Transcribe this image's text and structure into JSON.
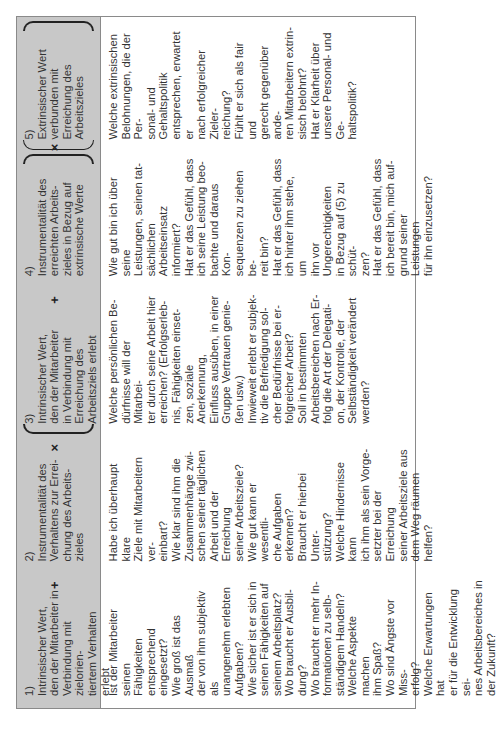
{
  "columns": [
    {
      "header": "1)\nIntrinsischer Wert,\nden der Mitarbeiter in\nVerbindung mit zielorien-\ntiertem Verhalten erlebt",
      "operator": "+",
      "body": "Ist der Mitarbeiter seinen\nFähigkeiten entsprechend\neingesetzt?\nWie groß ist das Ausmaß\nder von ihm subjektiv als\nunangenehm erlebten\nAufgaben?\nWie sicher ist er sich in\nseinen Fähigkeiten auf\nseinem Arbeitsplatz?\nWo braucht er Ausbil-\ndung?\nWo braucht er mehr In-\nformationen zu selb-\nständigem Handeln?\nWelche Aspekte machen\nihm Spaß?\nWo sind Ängste vor Miss-\nerfolg?\nWelche Erwartungen hat\ner für die Entwicklung sei-\nnes Arbeitsbereiches in\nder Zukunft?"
    },
    {
      "header": "2)\nInstrumentalität des\nVerhaltens zur Errei-\nchung des Arbeits-\nzieles",
      "operator": "×",
      "body": "Habe ich überhaupt klare\nZiele mit Mitarbeitern ver-\neinbart?\nWie klar sind ihm die\nZusammenhänge zwi-\nschen seiner täglichen\nArbeit und der Erreichung\nseiner Arbeitsziele?\nWie gut kann er wesentli-\nche Aufgaben erkennen?\nBraucht er hierbei Unter-\nstützung?\nWelche Hindernisse kann\nich ihm als sein Vorge-\nsetzter bei der Erreichung\nseiner Arbeitsziele aus\ndem Weg räumen helfen?"
    },
    {
      "header": "3)\nIntrinsischer Wert,\nden der Mitarbeiter\nin Verbindung mit\nErreichung des\nArbeitsziels erlebt",
      "operator": "+",
      "body": "Welche persönlichen Be-\ndürfnisse will der Mitarbei-\nter durch seine Arbeit hier\nerreichen? (Erfolgserleb-\nnis, Fähigkeiten einset-\nzen, soziale Anerkennung,\nEinfluss ausüben, in einer\nGruppe Vertrauen genie-\nßen usw.)\nInwieweit erlebt er subjek-\ntiv die Befriedigung sol-\ncher Bedürfnisse bei er-\nfolgreicher Arbeit?\nSoll in bestimmten\nArbeitsbereichen nach Er-\nfolg die Art der Delegati-\non, der Kontrolle, der\nSelbständigkeit verändert\nwerden?"
    },
    {
      "header": "4)\nInstrumentalität des\nerreichten Arbeits-\nzieles in Bezug auf\nextrinsische Werte",
      "operator": "×",
      "body": "Wie gut bin ich über seine\nLeistungen, seinen tat-\nsächlichen Arbeitseinsatz\ninformiert?\nHat er das Gefühl, dass\nich seine Leistung beo-\nbachte und daraus Kon-\nsequenzen zu ziehen be-\nreit bin?\nHat er das Gefühl, dass\nich hinter ihm stehe, um\nihn vor Ungerechtigkeiten\nin Bezug auf (5) zu schüt-\nzen?\nHat er das Gefühl, dass\nich bereit bin, mich auf-\ngrund seiner Leistungen\nfür ihn einzusetzen?"
    },
    {
      "header": "5)\nExtrinsischer Wert\nverbunden mit\nErreichung des\nArbeitszieles",
      "operator": "",
      "body": "Welche extrinsischen\nBelohnungen, die der Per-\nsonal- und Gehaltspolitik\nentsprechen, erwartet er\nnach erfolgreicher Zieler-\nreichung?\nFühlt er sich als fair und\ngerecht gegenüber ande-\nren Mitarbeitern extrin-\nsisch belohnt?\nHat er Klarheit über\nunsere Personal- und Ge-\nhaltspolitik?"
    }
  ],
  "colors": {
    "header_bg": "#c8c8c8",
    "border": "#8a8a8a",
    "text": "#333333"
  }
}
